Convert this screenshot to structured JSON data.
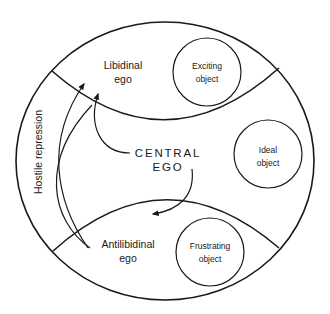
{
  "diagram": {
    "type": "psychic-structure-model",
    "regions": {
      "libidinal_ego": {
        "line1": "Libidinal",
        "line2": "ego"
      },
      "antilibidinal_ego": {
        "line1": "Antilibidinal",
        "line2": "ego"
      },
      "central_ego": {
        "line1": "CENTRAL",
        "line2": "EGO"
      },
      "hostile_repression": "Hostile repression"
    },
    "objects": {
      "exciting": {
        "line1": "Exciting",
        "line2": "object"
      },
      "ideal": {
        "line1": "Ideal",
        "line2": "object"
      },
      "frustrating": {
        "line1": "Frustrating",
        "line2": "object"
      }
    },
    "arrows": [
      {
        "from": "central_ego",
        "to": "libidinal_ego"
      },
      {
        "from": "central_ego",
        "to": "antilibidinal_ego"
      },
      {
        "from": "antilibidinal_ego",
        "to": "libidinal_ego",
        "label": "Hostile repression"
      }
    ]
  }
}
